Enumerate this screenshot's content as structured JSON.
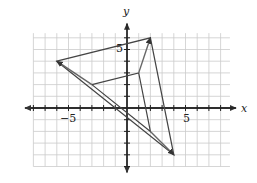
{
  "axes": {
    "x_label": "x",
    "y_label": "y",
    "x_tick_label_neg": "−5",
    "x_tick_label_pos": "5",
    "y_tick_label_pos": "5",
    "x_range": [
      -9,
      9
    ],
    "y_range": [
      -5,
      7
    ]
  },
  "figures": {
    "large_triangle": {
      "vertices": [
        [
          -6,
          4
        ],
        [
          2,
          6
        ],
        [
          4,
          -4
        ]
      ]
    },
    "small_triangle": {
      "vertices": [
        [
          -3,
          2
        ],
        [
          1,
          3
        ],
        [
          2,
          -2
        ]
      ]
    },
    "arrows": [
      {
        "from": [
          -3,
          2
        ],
        "to": [
          -6,
          4
        ]
      },
      {
        "from": [
          1,
          3
        ],
        "to": [
          2,
          6
        ]
      },
      {
        "from": [
          2,
          -2
        ],
        "to": [
          4,
          -4
        ]
      }
    ]
  },
  "colors": {
    "grid": "#cccccc",
    "axis": "#222222",
    "shape": "#444444"
  }
}
